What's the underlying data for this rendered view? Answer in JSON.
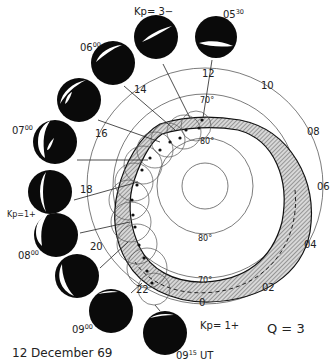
{
  "figure": {
    "date_label": "12 December 69",
    "q_label": "Q = 3",
    "end_time_label": "0915 UT",
    "polar_plot": {
      "center": [
        205,
        186
      ],
      "rings": [
        {
          "r": 23,
          "label": ""
        },
        {
          "r": 48,
          "label": "80°"
        },
        {
          "r": 92,
          "label": "70°"
        },
        {
          "r": 118,
          "label": ""
        }
      ],
      "ring_labels": {
        "top_80": "80°",
        "bottom_80": "80°",
        "top_70": "70°",
        "bottom_70": "70°"
      },
      "hour_labels": [
        {
          "text": "12",
          "angle": 0
        },
        {
          "text": "10",
          "angle": 30
        },
        {
          "text": "08",
          "angle": 60
        },
        {
          "text": "06",
          "angle": 90
        },
        {
          "text": "04",
          "angle": 120
        },
        {
          "text": "02",
          "angle": 150
        },
        {
          "text": "0",
          "angle": 180
        },
        {
          "text": "22",
          "angle": 210
        },
        {
          "text": "20",
          "angle": 240
        },
        {
          "text": "18",
          "angle": 270
        },
        {
          "text": "16",
          "angle": 300
        },
        {
          "text": "14",
          "angle": 330
        }
      ]
    },
    "allsky_images": [
      {
        "time": "05",
        "time_sup": "30",
        "kp": "",
        "cx": 216,
        "cy": 37
      },
      {
        "time": "",
        "time_sup": "",
        "kp": "Kp= 3−",
        "cx": 156,
        "cy": 37
      },
      {
        "time": "06",
        "time_sup": "00",
        "kp": "",
        "cx": 113,
        "cy": 63
      },
      {
        "time": "",
        "time_sup": "",
        "kp": "",
        "cx": 79,
        "cy": 100
      },
      {
        "time": "07",
        "time_sup": "00",
        "kp": "",
        "cx": 55,
        "cy": 142
      },
      {
        "time": "",
        "time_sup": "",
        "kp": "",
        "cx": 50,
        "cy": 192
      },
      {
        "time": "08",
        "time_sup": "00",
        "kp": "Kp=1+",
        "cx": 56,
        "cy": 235
      },
      {
        "time": "",
        "time_sup": "",
        "kp": "",
        "cx": 77,
        "cy": 276
      },
      {
        "time": "09",
        "time_sup": "00",
        "kp": "",
        "cx": 111,
        "cy": 311
      },
      {
        "time": "09",
        "time_sup": "15",
        "kp": "Kp= 1+",
        "cx": 165,
        "cy": 333
      }
    ],
    "kp_labels": [
      {
        "text": "Kp= 3−",
        "x": 134,
        "y": 13
      },
      {
        "text": "Kp=1+",
        "x": 8,
        "y": 216
      },
      {
        "text": "Kp= 1+",
        "x": 200,
        "y": 328
      }
    ],
    "time_labels": [
      {
        "main": "05",
        "sup": "30",
        "x": 223,
        "y": 16
      },
      {
        "main": "06",
        "sup": "00",
        "x": 80,
        "y": 49
      },
      {
        "main": "07",
        "sup": "00",
        "x": 12,
        "y": 132
      },
      {
        "main": "08",
        "sup": "00",
        "x": 18,
        "y": 257
      },
      {
        "main": "09",
        "sup": "00",
        "x": 72,
        "y": 331
      },
      {
        "main": "09",
        "sup": "15",
        "x": 176,
        "y": 358
      }
    ],
    "ut_suffix": "UT"
  }
}
